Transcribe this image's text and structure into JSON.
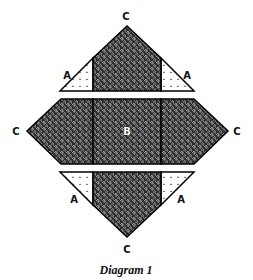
{
  "diagram": {
    "caption": "Diagram 1",
    "labels": {
      "top": "C",
      "left": "C",
      "right": "C",
      "bottom": "C",
      "top_left": "A",
      "top_right": "A",
      "bottom_left": "A",
      "bottom_right": "A",
      "center": "B"
    },
    "colors": {
      "dark_fabric": "#3a3a3a",
      "light_fabric": "#ffffff",
      "outline": "#000000"
    },
    "pieces": [
      {
        "id": "top-triangle",
        "unit": "C",
        "fabric": "swirl"
      },
      {
        "id": "top-left-corner",
        "unit": "A",
        "fabric": "dotted"
      },
      {
        "id": "top-right-corner",
        "unit": "A",
        "fabric": "dotted"
      },
      {
        "id": "middle-left",
        "unit": "C",
        "fabric": "swirl"
      },
      {
        "id": "center-square",
        "unit": "B",
        "fabric": "swirl"
      },
      {
        "id": "middle-right",
        "unit": "C",
        "fabric": "swirl"
      },
      {
        "id": "bottom-left-corner",
        "unit": "A",
        "fabric": "dotted"
      },
      {
        "id": "bottom-right-corner",
        "unit": "A",
        "fabric": "dotted"
      },
      {
        "id": "bottom-triangle",
        "unit": "C",
        "fabric": "swirl"
      }
    ]
  }
}
